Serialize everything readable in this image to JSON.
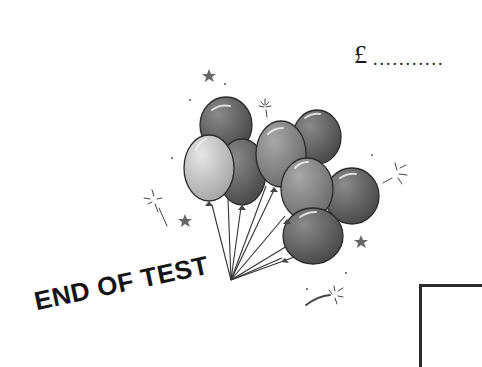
{
  "answer": {
    "currency_symbol": "£",
    "dots": "..........."
  },
  "illustration": {
    "subject": "balloon-bunch",
    "balloon_count": 9,
    "colors": {
      "dark": "#5a5a5a",
      "mid": "#7e7e7e",
      "light": "#b8b8b8",
      "outline": "#2b2b2b"
    }
  },
  "footer": {
    "end_label": "END OF TEST"
  }
}
